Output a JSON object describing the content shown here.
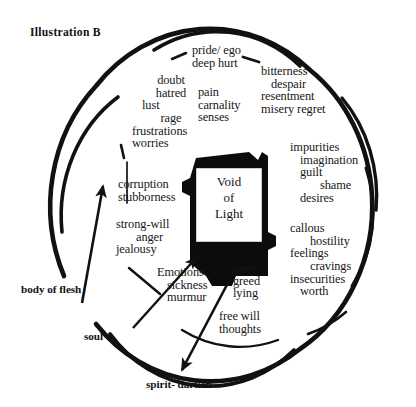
{
  "figure": {
    "title": "Illustration B",
    "center_box": {
      "lines": [
        "Void",
        "of",
        "Light"
      ]
    },
    "annotations": [
      {
        "name": "body-of-flesh",
        "text": "body of flesh"
      },
      {
        "name": "soul",
        "text": "soul"
      },
      {
        "name": "spirit-darken",
        "text": "spirit- darken"
      }
    ],
    "word_groups": [
      {
        "name": "group-pride",
        "words": [
          "pride/ ego",
          "deep  hurt"
        ]
      },
      {
        "name": "group-doubt",
        "words": [
          "doubt",
          "hatred",
          "lust",
          "rage",
          "frustrations",
          "worries"
        ]
      },
      {
        "name": "group-pain",
        "words": [
          "pain",
          "carnality",
          "senses"
        ]
      },
      {
        "name": "group-bitterness",
        "words": [
          "bitterness",
          "despair",
          "resentment",
          "misery  regret"
        ]
      },
      {
        "name": "group-corruption",
        "words": [
          "corruption",
          "stubborness"
        ]
      },
      {
        "name": "group-strong-will",
        "words": [
          "strong-will",
          "anger",
          "jealousy"
        ]
      },
      {
        "name": "group-emotions",
        "words": [
          "Emotions",
          "sickness",
          "murmur"
        ]
      },
      {
        "name": "group-impurities",
        "words": [
          "impurities",
          "imagination",
          "guilt",
          "shame",
          "desires"
        ]
      },
      {
        "name": "group-callous",
        "words": [
          "callous",
          "hostility",
          "feelings",
          "cravings",
          "insecurities",
          "worth"
        ]
      },
      {
        "name": "group-envy",
        "words": [
          "envy",
          "greed",
          "lying"
        ]
      },
      {
        "name": "group-free-will",
        "words": [
          "free will",
          "thoughts"
        ]
      }
    ],
    "colors": {
      "ink": "#111111",
      "background": "#ffffff"
    }
  }
}
